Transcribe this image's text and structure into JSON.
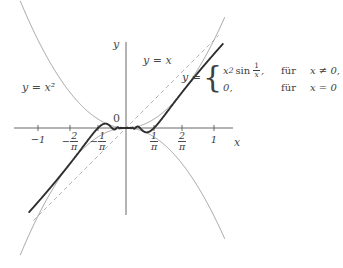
{
  "figure": {
    "kind": "line",
    "background": "#ffffff",
    "axis_color": "#58585a",
    "thin_curve_color": "#8a8a8c",
    "dashed_curve_color": "#9a9a9c",
    "thick_curve_color": "#2e2e30"
  },
  "axes": {
    "x_label": "x",
    "y_label": "y",
    "origin_label": "0",
    "x_ticks": [
      {
        "id": "minus-one",
        "text": "−1",
        "kind": "plain"
      },
      {
        "id": "minus-two-over-pi",
        "sign": "−",
        "num": "2",
        "den": "π",
        "kind": "fraction"
      },
      {
        "id": "minus-one-over-pi",
        "sign": "−",
        "num": "1",
        "den": "π",
        "kind": "fraction"
      },
      {
        "id": "one-over-pi",
        "sign": "",
        "num": "1",
        "den": "π",
        "kind": "fraction"
      },
      {
        "id": "two-over-pi",
        "sign": "",
        "num": "2",
        "den": "π",
        "kind": "fraction"
      },
      {
        "id": "one",
        "text": "1",
        "kind": "plain"
      }
    ]
  },
  "curve_labels": {
    "parabola": "y = x²",
    "identity": "y = x"
  },
  "formula": {
    "lhs": "y =",
    "case1_expr_x": "x",
    "case1_expr_sup": "2",
    "case1_op": "sin",
    "case1_frac_num": "1",
    "case1_frac_den": "x",
    "case1_comma": ",",
    "case1_word": "für",
    "case1_cond": "x ≠ 0,",
    "case2_expr": "0,",
    "case2_word": "für",
    "case2_cond": "x = 0"
  },
  "chart_data": {
    "type": "line",
    "title": "",
    "xlabel": "x",
    "ylabel": "y",
    "grid": false,
    "legend": "inline-annotations",
    "xlim": [
      -1.22,
      1.12
    ],
    "ylim": [
      -1.05,
      1.15
    ],
    "x_tick_values": [
      -1,
      -0.6366,
      -0.3183,
      0.3183,
      0.6366,
      1
    ],
    "x_tick_labels": [
      "−1",
      "−2/π",
      "−1/π",
      "1/π",
      "2/π",
      "1"
    ],
    "annotations": [
      {
        "text": "y = x²",
        "target": "upper envelope parabola"
      },
      {
        "text": "y = x",
        "target": "dashed identity line"
      },
      {
        "text": "y = x² sin(1/x) for x≠0; 0 for x=0",
        "target": "thick oscillating curve"
      },
      {
        "text": "0",
        "target": "origin"
      }
    ],
    "series": [
      {
        "name": "y = x^2",
        "style": "thin solid",
        "color": "#8a8a8c",
        "formula": "x^2"
      },
      {
        "name": "y = -x^2",
        "style": "thin solid",
        "color": "#8a8a8c",
        "formula": "-x^2"
      },
      {
        "name": "y = x",
        "style": "dashed",
        "color": "#9a9a9c",
        "formula": "x"
      },
      {
        "name": "y = x^2 sin(1/x)",
        "style": "thick solid",
        "color": "#2e2e30",
        "formula": "x^2*sin(1/x), 0 at x=0"
      }
    ]
  }
}
